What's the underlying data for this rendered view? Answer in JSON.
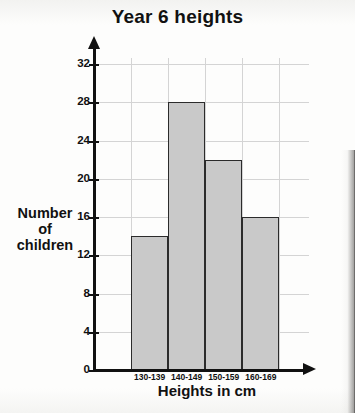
{
  "chart_data": {
    "type": "bar",
    "title": "Year 6 heights",
    "xlabel": "Heights in cm",
    "ylabel_lines": [
      "Number",
      "of",
      "children"
    ],
    "ylabel": "Number of children",
    "categories": [
      "130-139",
      "140-149",
      "150-159",
      "160-169"
    ],
    "values": [
      14,
      28,
      22,
      16
    ],
    "ylim": [
      0,
      32
    ],
    "ytick_step": 4,
    "yticks": [
      "0",
      "4",
      "8",
      "12",
      "16",
      "20",
      "24",
      "28",
      "32"
    ],
    "grid": "both",
    "legend": "none",
    "bar_fill_color": "#c9c9c9",
    "bar_border_color": "#2b2b2b",
    "axis_color": "#111111",
    "grid_color": "#d4d4d4",
    "background_color": "#fdfdfc"
  }
}
